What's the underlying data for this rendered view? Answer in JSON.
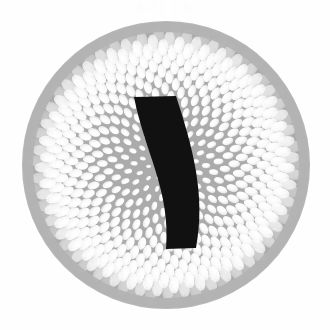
{
  "canvas": {
    "width": 330,
    "height": 330,
    "background_color": "#fefefe"
  },
  "watermark": {
    "text": "KPT ES",
    "color": "#fcfcfc",
    "position": "top-center",
    "visible": "barely"
  },
  "artwork": {
    "title": "Phyllotaxis Disk with Curved Stroke",
    "description": "Grey circular disk filled with a white golden-angle sunflower spiral of elliptical seeds, overlaid by a solid black curved vertical stroke glyph",
    "style": "halftone-engraving"
  },
  "disk": {
    "name": "phyllotaxis-disk",
    "center_x": 166,
    "center_y": 165,
    "radius": 143,
    "fill_color": "#ababab",
    "rim_color": "#b4b4b4",
    "rim_margin": 9,
    "edge_softness": 1.5
  },
  "phyllotaxis": {
    "name": "sunflower-spiral",
    "seed_count": 620,
    "golden_angle_deg": 137.507764,
    "spacing_coefficient": 5.85,
    "seed_shape": "ellipse",
    "seed_fill_color": "#fdfdfd",
    "seed_dim_color": "#e9e9e9",
    "seed_min_radius": 0.85,
    "seed_max_radius": 9.2,
    "seed_aspect_ratio": 1.62,
    "seed_radius_exponent": 0.78,
    "orientation": "radial-major-axis",
    "rotation_offset_deg": 18,
    "outer_clip_radius": 134
  },
  "stroke_glyph": {
    "name": "black-curved-stroke",
    "glyph": ")",
    "fill_color": "#111111",
    "top_left_x": 134,
    "top_left_y": 97,
    "top_right_x": 176,
    "top_right_y": 96,
    "bottom_left_x": 166,
    "bottom_left_y": 249,
    "bottom_right_x": 196,
    "bottom_right_y": 248,
    "curvature": "convex-right",
    "cap_style": "flat-horizontal",
    "width_top": 42,
    "width_bottom": 30
  },
  "palette": {
    "background": "#fefefe",
    "disk_grey": "#ababab",
    "seed_white": "#fdfdfd",
    "stroke_black": "#111111"
  }
}
